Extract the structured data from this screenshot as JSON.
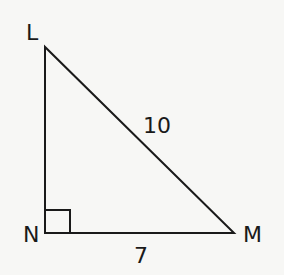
{
  "figure": {
    "type": "right-triangle",
    "vertices": {
      "L": {
        "label": "L"
      },
      "N": {
        "label": "N"
      },
      "M": {
        "label": "M"
      }
    },
    "right_angle_at": "N",
    "sides": {
      "LM": {
        "label": "10"
      },
      "NM": {
        "label": "7"
      }
    },
    "colors": {
      "stroke": "#1a1a1a",
      "background": "#f7f7f5"
    }
  }
}
